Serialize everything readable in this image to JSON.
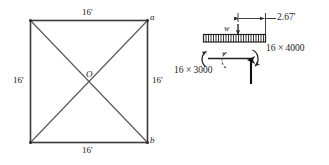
{
  "figure": {
    "colors": {
      "line": "#333333",
      "diagonal": "#555555",
      "text": "#1a1a1a",
      "background": "#ffffff"
    }
  },
  "square_diagram": {
    "name": "square-frame",
    "top_dimension": "16'",
    "bottom_dimension": "16'",
    "left_dimension": "16'",
    "right_dimension": "16'",
    "center_label": "O",
    "corner_top_right_label": "a",
    "corner_bottom_right_label": "b"
  },
  "beam_diagram": {
    "name": "beam-free-body",
    "distributed_load_label": "w",
    "offset_dimension": "2.67'",
    "left_moment_label": "16 × 3000",
    "right_moment_label": "16 × 4000"
  }
}
